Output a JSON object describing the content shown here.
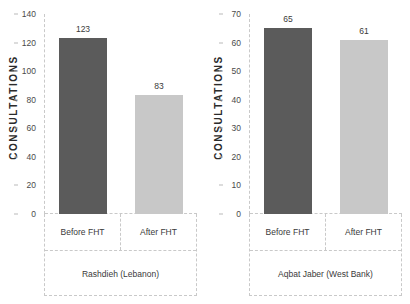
{
  "chart_data": [
    {
      "type": "bar",
      "title": "Rashdieh (Lebanon)",
      "xlabel": "",
      "ylabel": "CONSULTATIONS",
      "categories": [
        "Before FHT",
        "After FHT"
      ],
      "values": [
        123,
        83
      ],
      "ylim": [
        0,
        140
      ],
      "yticks": [
        0,
        20,
        40,
        60,
        80,
        100,
        120,
        140
      ],
      "grid": false,
      "legend": "none",
      "colors": [
        "#5b5b5b",
        "#c8c8c8"
      ]
    },
    {
      "type": "bar",
      "title": "Aqbat Jaber (West Bank)",
      "xlabel": "",
      "ylabel": "CONSULTATIONS",
      "categories": [
        "Before FHT",
        "After FHT"
      ],
      "values": [
        65,
        61
      ],
      "ylim": [
        0,
        70
      ],
      "yticks": [
        0,
        10,
        20,
        30,
        40,
        50,
        60,
        70
      ],
      "grid": false,
      "legend": "none",
      "colors": [
        "#5b5b5b",
        "#c8c8c8"
      ]
    }
  ]
}
